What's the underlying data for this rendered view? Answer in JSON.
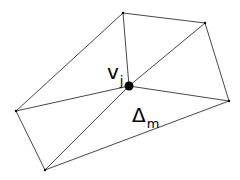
{
  "diagram": {
    "type": "triangle-mesh-vertex-star",
    "colors": {
      "edge": "#333333",
      "vertex": "#000000",
      "background": "#ffffff"
    },
    "vertices": [
      {
        "id": "center",
        "x": 129,
        "y": 86,
        "r": 4.5
      },
      {
        "id": "top",
        "x": 123,
        "y": 13,
        "r": 1.2
      },
      {
        "id": "top-right",
        "x": 205,
        "y": 23,
        "r": 1.2
      },
      {
        "id": "right",
        "x": 229,
        "y": 101,
        "r": 1.2
      },
      {
        "id": "bottom",
        "x": 45,
        "y": 170,
        "r": 1.2
      },
      {
        "id": "left",
        "x": 16,
        "y": 111,
        "r": 1.2
      }
    ],
    "edges": [
      [
        "center",
        "top"
      ],
      [
        "center",
        "top-right"
      ],
      [
        "center",
        "right"
      ],
      [
        "center",
        "bottom"
      ],
      [
        "center",
        "left"
      ],
      [
        "top",
        "top-right"
      ],
      [
        "top-right",
        "right"
      ],
      [
        "right",
        "bottom"
      ],
      [
        "bottom",
        "left"
      ],
      [
        "left",
        "top"
      ]
    ],
    "labels": {
      "vertex_label": {
        "main": "v",
        "sub": "j"
      },
      "triangle_label": {
        "main": "Δ",
        "sub": "m"
      }
    }
  }
}
